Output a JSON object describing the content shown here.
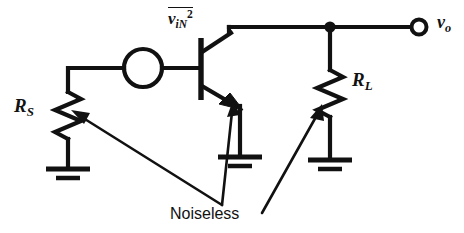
{
  "figure": {
    "type": "circuit-schematic",
    "background_color": "#ffffff",
    "ink_color": "#111111"
  },
  "labels": {
    "source_resistor": {
      "symbol": "R",
      "subscript": "S",
      "text": "RS"
    },
    "load_resistor": {
      "symbol": "R",
      "subscript": "L",
      "text": "RL"
    },
    "output_node": {
      "symbol": "v",
      "subscript": "o",
      "text": "vo"
    },
    "noise_source": {
      "symbol": "v",
      "subscript": "iN",
      "superscript": "2",
      "overbar": true,
      "text": "viN2"
    },
    "annotation": "Noiseless"
  },
  "components": [
    {
      "name": "source-resistor",
      "kind": "resistor",
      "label": "RS"
    },
    {
      "name": "noise-voltage-source",
      "kind": "voltage-source-circle",
      "label": "viN2"
    },
    {
      "name": "npn-transistor",
      "kind": "bjt-npn",
      "label": ""
    },
    {
      "name": "load-resistor",
      "kind": "resistor",
      "label": "RL"
    },
    {
      "name": "output-terminal",
      "kind": "open-terminal",
      "label": "vo"
    }
  ],
  "grounds": [
    {
      "name": "ground-source",
      "bars": 2
    },
    {
      "name": "ground-emitter",
      "bars": 2
    },
    {
      "name": "ground-load",
      "bars": 2
    }
  ],
  "annotation_arrows": [
    {
      "name": "arrow-to-source-resistor",
      "target": "RS"
    },
    {
      "name": "arrow-to-transistor",
      "target": "transistor"
    },
    {
      "name": "arrow-to-load-resistor",
      "target": "RL"
    }
  ]
}
